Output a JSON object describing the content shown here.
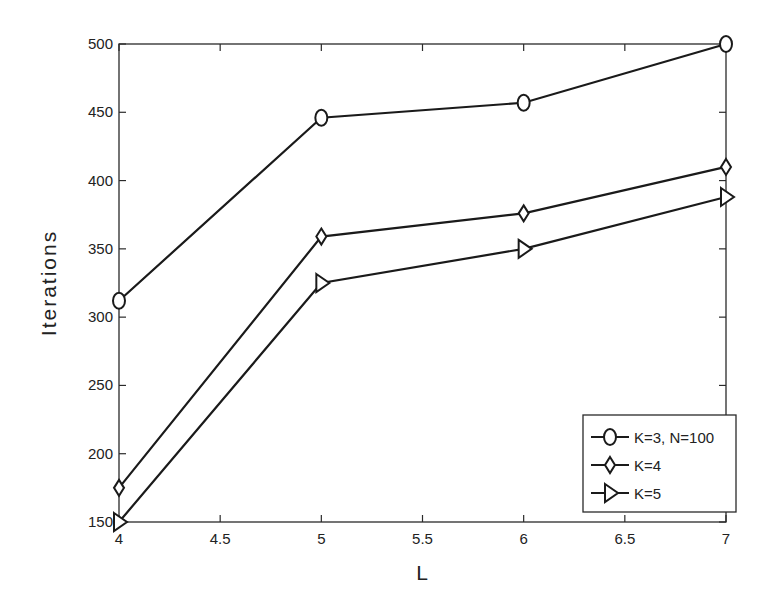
{
  "chart_data": {
    "type": "line",
    "title": "",
    "xlabel": "L",
    "ylabel": "Iterations",
    "x": [
      4,
      5,
      6,
      7
    ],
    "xlim": [
      4,
      7
    ],
    "ylim": [
      150,
      500
    ],
    "xticks": [
      "4",
      "4.5",
      "5",
      "5.5",
      "6",
      "6.5",
      "7"
    ],
    "xtick_values": [
      4,
      4.5,
      5,
      5.5,
      6,
      6.5,
      7
    ],
    "yticks": [
      "150",
      "200",
      "250",
      "300",
      "350",
      "400",
      "450",
      "500"
    ],
    "ytick_values": [
      150,
      200,
      250,
      300,
      350,
      400,
      450,
      500
    ],
    "grid": false,
    "legend_position": "bottom-right",
    "series": [
      {
        "name": "K=3, N=100",
        "marker": "circle",
        "color": "#1a1a1a",
        "values": [
          312,
          446,
          457,
          500
        ]
      },
      {
        "name": "K=4",
        "marker": "diamond",
        "color": "#1a1a1a",
        "values": [
          175,
          359,
          376,
          410
        ]
      },
      {
        "name": "K=5",
        "marker": "triangle-right",
        "color": "#1a1a1a",
        "values": [
          150,
          325,
          350,
          388
        ]
      }
    ]
  }
}
